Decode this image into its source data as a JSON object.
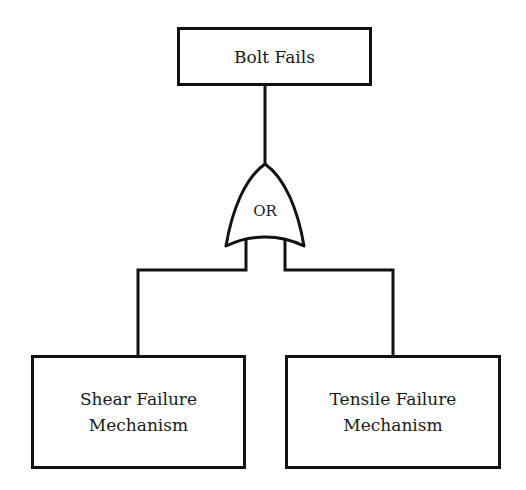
{
  "diagram": {
    "type": "fault-tree",
    "top_event": {
      "label": "Bolt Fails"
    },
    "gate": {
      "type": "OR",
      "label": "OR"
    },
    "basic_events": [
      {
        "line1": "Shear Failure",
        "line2": "Mechanism"
      },
      {
        "line1": "Tensile Failure",
        "line2": "Mechanism"
      }
    ],
    "colors": {
      "stroke": "#111111",
      "background": "#ffffff",
      "text": "#1a1a1a"
    }
  }
}
